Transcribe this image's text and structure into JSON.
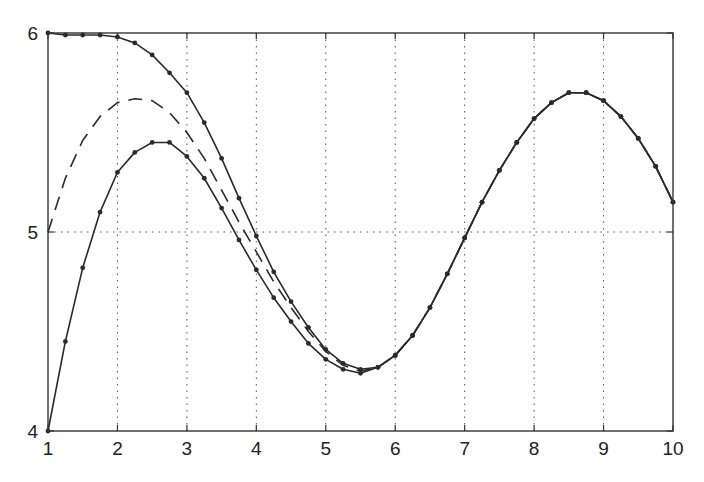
{
  "chart_data": {
    "type": "line",
    "title": "",
    "xlabel": "",
    "ylabel": "",
    "xlim": [
      1,
      10
    ],
    "ylim": [
      4,
      6
    ],
    "x_ticks": [
      1,
      2,
      3,
      4,
      5,
      6,
      7,
      8,
      9,
      10
    ],
    "y_ticks": [
      4,
      5,
      6
    ],
    "grid": {
      "vertical": true,
      "horizontal_y": [
        5
      ],
      "style": "dotted"
    },
    "legend": null,
    "x": [
      1,
      1.25,
      1.5,
      1.75,
      2,
      2.25,
      2.5,
      2.75,
      3,
      3.25,
      3.5,
      3.75,
      4,
      4.25,
      4.5,
      4.75,
      5,
      5.25,
      5.5,
      5.75,
      6,
      6.25,
      6.5,
      6.75,
      7,
      7.25,
      7.5,
      7.75,
      8,
      8.25,
      8.5,
      8.75,
      9,
      9.25,
      9.5,
      9.75,
      10
    ],
    "series": [
      {
        "name": "upper (markers)",
        "style": "solid-dots",
        "values": [
          6.0,
          5.99,
          5.99,
          5.99,
          5.98,
          5.95,
          5.89,
          5.8,
          5.7,
          5.55,
          5.37,
          5.17,
          4.98,
          4.8,
          4.65,
          4.52,
          4.41,
          4.34,
          4.31,
          4.32,
          4.38,
          4.48,
          4.62,
          4.79,
          4.97,
          5.15,
          5.31,
          5.45,
          5.57,
          5.65,
          5.7,
          5.7,
          5.66,
          5.58,
          5.47,
          5.33,
          5.15
        ]
      },
      {
        "name": "middle (dashed)",
        "style": "dashed",
        "values": [
          5.0,
          5.27,
          5.46,
          5.58,
          5.65,
          5.67,
          5.66,
          5.6,
          5.5,
          5.37,
          5.21,
          5.05,
          4.9,
          4.75,
          4.62,
          4.5,
          4.4,
          4.33,
          4.3,
          4.32,
          4.38,
          4.48,
          4.62,
          4.79,
          4.97,
          5.15,
          5.31,
          5.45,
          5.57,
          5.65,
          5.7,
          5.7,
          5.66,
          5.58,
          5.47,
          5.33,
          5.15
        ]
      },
      {
        "name": "lower (markers)",
        "style": "solid-dots",
        "values": [
          4.0,
          4.45,
          4.82,
          5.1,
          5.3,
          5.4,
          5.45,
          5.45,
          5.38,
          5.27,
          5.12,
          4.96,
          4.81,
          4.67,
          4.55,
          4.44,
          4.36,
          4.31,
          4.29,
          4.32,
          4.38,
          4.48,
          4.62,
          4.79,
          4.97,
          5.15,
          5.31,
          5.45,
          5.57,
          5.65,
          5.7,
          5.7,
          5.66,
          5.58,
          5.47,
          5.33,
          5.15
        ]
      }
    ]
  },
  "colors": {
    "line": "#2a2a2a",
    "grid": "#555555",
    "axis": "#333333"
  }
}
